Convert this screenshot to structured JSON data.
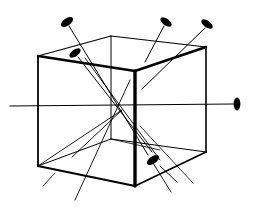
{
  "diagram": {
    "colors": {
      "stroke": "#000000",
      "background": "#ffffff"
    },
    "cube": {
      "vertices": {
        "front_top_left": [
          38,
          56
        ],
        "back_top_left": [
          111,
          36
        ],
        "back_top_right": [
          206,
          47
        ],
        "front_top_right": [
          135,
          71
        ],
        "front_bottom_left": [
          38,
          166
        ],
        "front_bottom_right": [
          135,
          186
        ],
        "back_bottom_right": [
          206,
          152
        ],
        "back_bottom_left": [
          111,
          139
        ]
      }
    },
    "center": [
      122,
      110
    ],
    "axes": [
      {
        "name": "horizontal-axis",
        "from": [
          10,
          106
        ],
        "to": [
          237,
          104
        ],
        "marker": [
          237,
          104
        ],
        "marker_angle": 90
      },
      {
        "name": "diagonal-axis-a",
        "from": [
          67,
          22
        ],
        "to": [
          148,
          155
        ],
        "marker": [
          67,
          22
        ],
        "marker_angle": -35,
        "tail_dashed": [
          [
            150,
            160
          ],
          [
            172,
            193
          ]
        ]
      },
      {
        "name": "diagonal-axis-b",
        "from": [
          75,
          53
        ],
        "to": [
          153,
          160
        ],
        "marker": [
          75,
          53
        ],
        "marker_angle": -35,
        "tail_dashed": [
          [
            158,
            165
          ],
          [
            178,
            182
          ]
        ]
      },
      {
        "name": "diagonal-axis-c",
        "from": [
          166,
          22
        ],
        "to": [
          75,
          200
        ],
        "marker": [
          166,
          22
        ],
        "marker_angle": 35
      },
      {
        "name": "diagonal-axis-d",
        "from": [
          207,
          24
        ],
        "to": [
          43,
          186
        ],
        "marker": [
          207,
          24
        ],
        "marker_angle": 35,
        "gap": [
          [
            140,
            90
          ],
          [
            75,
            155
          ]
        ]
      },
      {
        "name": "lower-axis-e",
        "from": [
          122,
          110
        ],
        "to": [
          153,
          160
        ],
        "marker": [
          153,
          160
        ],
        "marker_angle": -35
      }
    ]
  }
}
